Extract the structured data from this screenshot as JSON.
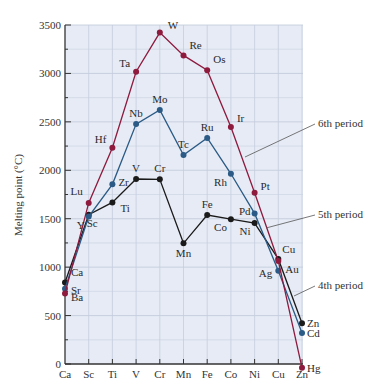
{
  "chart_data": {
    "type": "line",
    "title": "",
    "xlabel": "",
    "ylabel": "Melting point (°C)",
    "ylim": [
      0,
      3500
    ],
    "yticks": [
      0,
      500,
      1000,
      1500,
      2000,
      2500,
      3000,
      3500
    ],
    "grid": true,
    "categories": [
      "Ca",
      "Sc",
      "Ti",
      "V",
      "Cr",
      "Mn",
      "Fe",
      "Co",
      "Ni",
      "Cu",
      "Zn"
    ],
    "series": [
      {
        "name": "4th period",
        "color": "#1a1a1a",
        "elements": [
          "Ca",
          "Sc",
          "Ti",
          "V",
          "Cr",
          "Mn",
          "Fe",
          "Co",
          "Ni",
          "Cu",
          "Zn"
        ],
        "values": [
          842,
          1541,
          1668,
          1910,
          1907,
          1246,
          1538,
          1495,
          1455,
          1085,
          420
        ]
      },
      {
        "name": "5th period",
        "color": "#2a5a85",
        "elements": [
          "Sr",
          "Y",
          "Zr",
          "Nb",
          "Mo",
          "Tc",
          "Ru",
          "Rh",
          "Pd",
          "Ag",
          "Cd"
        ],
        "values": [
          777,
          1522,
          1855,
          2477,
          2623,
          2157,
          2334,
          1964,
          1555,
          962,
          321
        ]
      },
      {
        "name": "6th period",
        "color": "#8e1a3e",
        "elements": [
          "Ba",
          "Lu",
          "Hf",
          "Ta",
          "W",
          "Re",
          "Os",
          "Ir",
          "Pt",
          "Au",
          "Hg"
        ],
        "values": [
          727,
          1663,
          2233,
          3017,
          3422,
          3186,
          3033,
          2446,
          1768,
          1064,
          -39
        ]
      }
    ],
    "annotations": [
      "6th period",
      "5th period",
      "4th period"
    ],
    "legend_position": "right (leader-line labels)"
  },
  "colors": {
    "plot_background": "#e6ebf5",
    "grid": "#c5cddd",
    "axis": "#333333"
  }
}
